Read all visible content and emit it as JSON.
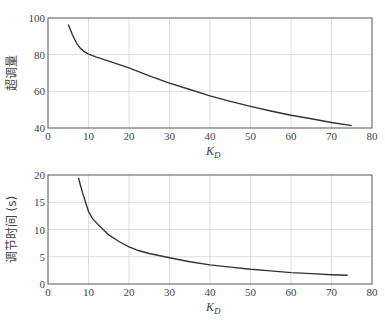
{
  "chart_data": [
    {
      "type": "line",
      "title": "",
      "xlabel": "K_D",
      "ylabel": "超调量",
      "xlim": [
        0,
        80
      ],
      "ylim": [
        40,
        100
      ],
      "xticks": [
        0,
        10,
        20,
        30,
        40,
        50,
        60,
        70,
        80
      ],
      "yticks": [
        40,
        60,
        80,
        100
      ],
      "grid": true,
      "series": [
        {
          "name": "超调量",
          "x": [
            5,
            6,
            7,
            8,
            9,
            10,
            12,
            15,
            20,
            25,
            30,
            35,
            40,
            45,
            50,
            55,
            60,
            65,
            70,
            75
          ],
          "values": [
            96.5,
            91,
            86.5,
            83.5,
            81.5,
            80.3,
            78.6,
            76.5,
            72.8,
            68.5,
            64.5,
            61,
            57.5,
            54.5,
            51.8,
            49.3,
            47,
            45,
            43,
            41.3
          ]
        }
      ]
    },
    {
      "type": "line",
      "title": "",
      "xlabel": "K_D",
      "ylabel": "调节时间 (s)",
      "xlim": [
        0,
        80
      ],
      "ylim": [
        0,
        20
      ],
      "xticks": [
        0,
        10,
        20,
        30,
        40,
        50,
        60,
        70,
        80
      ],
      "yticks": [
        0,
        5,
        10,
        15,
        20
      ],
      "grid": true,
      "series": [
        {
          "name": "调节时间",
          "x": [
            7.5,
            8.5,
            10,
            11,
            12.5,
            15,
            17.5,
            20,
            22.5,
            25,
            30,
            35,
            40,
            45,
            50,
            55,
            60,
            65,
            70,
            74
          ],
          "values": [
            19.5,
            16.8,
            13.3,
            12,
            10.8,
            9,
            7.8,
            6.8,
            6.1,
            5.6,
            4.8,
            4.1,
            3.5,
            3.1,
            2.7,
            2.4,
            2.1,
            1.9,
            1.7,
            1.6
          ]
        }
      ]
    }
  ],
  "labels": {
    "top_ylabel": "超调量",
    "bottom_ylabel": "调节时间 (s)",
    "xlabel_main": "K",
    "xlabel_sub": "D"
  }
}
